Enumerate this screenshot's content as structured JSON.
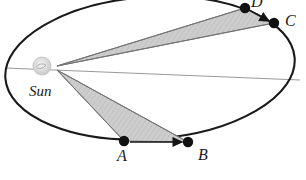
{
  "figure": {
    "type": "orbital-diagram",
    "concept": "Kepler second law equal areas",
    "width": 306,
    "height": 180,
    "background_color": "#ffffff"
  },
  "colors": {
    "orbit_stroke": "#1a1a1a",
    "sector_fill": "#c9c9c9",
    "sector_stroke": "#6e6e6e",
    "axis_line": "#9a9a9a",
    "radius_line": "#707070",
    "point_fill": "#111111",
    "sun_fill": "#d8d8d8",
    "sun_stroke": "#b4b4b4",
    "label_color": "#1a1a1a"
  },
  "orbit": {
    "name": "elliptical-orbit",
    "center": {
      "x": 150,
      "y": 68
    },
    "radius_x": 145,
    "radius_y": 71,
    "rotation_deg": -4,
    "stroke_width": 2.1
  },
  "major_axis": {
    "name": "major-axis-line",
    "x1": 5,
    "y1": 68,
    "x2": 300,
    "y2": 80,
    "stroke_width": 1
  },
  "sun": {
    "label": "Sun",
    "glyph": {
      "x": 42,
      "y": 66,
      "r": 9
    },
    "focus": {
      "x": 57,
      "y": 68
    },
    "label_pos": {
      "x": 29,
      "y": 84
    }
  },
  "points": [
    {
      "id": "A",
      "name": "orbit-point-a",
      "x": 124,
      "y": 141,
      "r": 5.2,
      "label_pos": {
        "x": 117,
        "y": 148
      }
    },
    {
      "id": "B",
      "name": "orbit-point-b",
      "x": 188,
      "y": 142,
      "r": 5.2,
      "label_pos": {
        "x": 198,
        "y": 147
      }
    },
    {
      "id": "C",
      "name": "orbit-point-c",
      "x": 274,
      "y": 23,
      "r": 5.2,
      "label_pos": {
        "x": 285,
        "y": 13
      }
    },
    {
      "id": "D",
      "name": "orbit-point-d",
      "x": 245,
      "y": 8,
      "r": 5.2,
      "label_pos": {
        "x": 251,
        "y": -6
      }
    }
  ],
  "sectors": [
    {
      "id": "sector-AB",
      "name": "swept-area-a-to-b",
      "description": "Shaded triangular area swept from A to B",
      "vertices": [
        {
          "x": 57,
          "y": 70
        },
        {
          "x": 124,
          "y": 141
        },
        {
          "x": 188,
          "y": 142
        }
      ]
    },
    {
      "id": "sector-CD",
      "name": "swept-area-c-to-d",
      "description": "Shaded triangular area swept from C to D",
      "vertices": [
        {
          "x": 57,
          "y": 66
        },
        {
          "x": 245,
          "y": 8
        },
        {
          "x": 274,
          "y": 23
        }
      ]
    }
  ],
  "radii": [
    {
      "name": "radius-sun-to-a",
      "x1": 57,
      "y1": 70,
      "x2": 124,
      "y2": 141
    },
    {
      "name": "radius-sun-to-b",
      "x1": 57,
      "y1": 70,
      "x2": 188,
      "y2": 142
    },
    {
      "name": "radius-sun-to-d",
      "x1": 57,
      "y1": 66,
      "x2": 245,
      "y2": 8
    },
    {
      "name": "radius-sun-to-c",
      "x1": 57,
      "y1": 66,
      "x2": 274,
      "y2": 23
    }
  ],
  "arrows": [
    {
      "name": "direction-arrow-a-to-b",
      "x1": 130,
      "y1": 142,
      "x2": 182,
      "y2": 142,
      "description": "Motion direction from A toward B"
    },
    {
      "name": "direction-arrow-d-to-c",
      "x1": 249,
      "y1": 10,
      "x2": 269,
      "y2": 21,
      "description": "Motion direction from D toward C"
    }
  ],
  "labels": {
    "sun": "Sun",
    "a": "A",
    "b": "B",
    "c": "C",
    "d": "D"
  }
}
